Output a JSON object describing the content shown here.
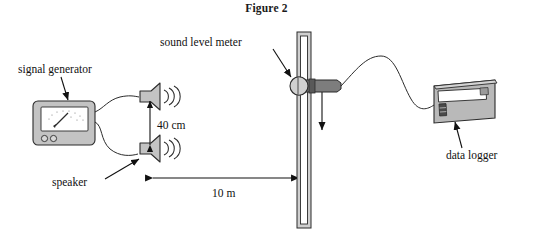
{
  "figure": {
    "title": "Figure 2",
    "caption_position": "top-center"
  },
  "labels": {
    "signal_generator": "signal generator",
    "sound_level_meter": "sound level meter",
    "speaker": "speaker",
    "data_logger": "data logger"
  },
  "dimensions": {
    "speaker_separation": "40 cm",
    "speaker_to_rail": "10 m"
  },
  "components": [
    {
      "name": "signal-generator",
      "label": "signal generator",
      "icon": "signal-generator-icon",
      "description": "grey instrument box with analogue meter display and two knobs"
    },
    {
      "name": "speaker-upper",
      "label": "speaker",
      "icon": "speaker-icon",
      "description": "cone loudspeaker emitting sound waves"
    },
    {
      "name": "speaker-lower",
      "label": "speaker",
      "icon": "speaker-icon",
      "description": "cone loudspeaker emitting sound waves"
    },
    {
      "name": "sound-level-meter",
      "label": "sound level meter",
      "icon": "microphone-icon",
      "description": "microphone mounted on a vertical track"
    },
    {
      "name": "vertical-rail",
      "label": "",
      "icon": "rail-icon",
      "description": "vertical slotted track along which the meter moves"
    },
    {
      "name": "data-logger",
      "label": "data logger",
      "icon": "data-logger-icon",
      "description": "grey box instrument with display strip and buttons"
    }
  ],
  "annotations": {
    "motion_arrow": "downward arrow indicating meter travel along the rail",
    "wave_arcs": "three concentric arcs at each speaker indicating emitted sound"
  },
  "colors": {
    "body_fill": "#bcbcbc",
    "body_fill_light": "#d4d4d4",
    "body_fill_dark": "#8f8f8f",
    "mic_body": "#7d7d7d",
    "mic_head": "#d0d0d0",
    "panel_white": "#ffffff",
    "outline": "#2b2b2b",
    "text": "#111111",
    "background": "#ffffff"
  }
}
